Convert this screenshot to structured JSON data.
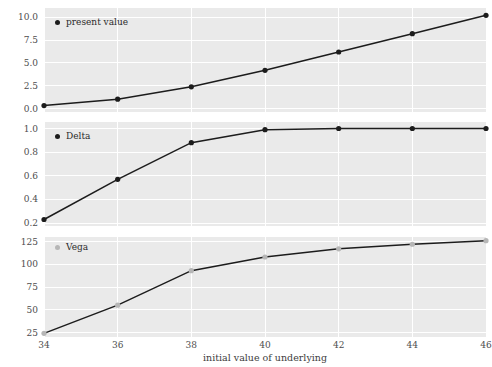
{
  "chart_data": [
    {
      "type": "line",
      "title": "",
      "xlabel": "",
      "ylabel": "",
      "legend": "present value",
      "legend_position": "upper left",
      "grid": true,
      "marker_color": "#1c1c1c",
      "line_color": "#1c1c1c",
      "x": [
        34,
        36,
        38,
        40,
        42,
        44,
        46
      ],
      "values": [
        0.35,
        1.05,
        2.4,
        4.2,
        6.2,
        8.2,
        10.2
      ],
      "xticks": [
        34,
        36,
        38,
        40,
        42,
        44,
        46
      ],
      "yticks": [
        0.0,
        2.5,
        5.0,
        7.5,
        10.0
      ],
      "ytick_labels": [
        "0.0",
        "2.5",
        "5.0",
        "7.5",
        "10.0"
      ],
      "xlim": [
        34,
        46
      ],
      "ylim": [
        -0.35,
        11.0
      ]
    },
    {
      "type": "line",
      "title": "",
      "xlabel": "",
      "ylabel": "",
      "legend": "Delta",
      "legend_position": "upper left",
      "grid": true,
      "marker_color": "#1c1c1c",
      "line_color": "#1c1c1c",
      "x": [
        34,
        36,
        38,
        40,
        42,
        44,
        46
      ],
      "values": [
        0.23,
        0.57,
        0.88,
        0.99,
        1.0,
        1.0,
        1.0
      ],
      "xticks": [
        34,
        36,
        38,
        40,
        42,
        44,
        46
      ],
      "yticks": [
        0.2,
        0.4,
        0.6,
        0.8,
        1.0
      ],
      "ytick_labels": [
        "0.2",
        "0.4",
        "0.6",
        "0.8",
        "1.0"
      ],
      "xlim": [
        34,
        46
      ],
      "ylim": [
        0.175,
        1.055
      ]
    },
    {
      "type": "line",
      "title": "",
      "xlabel": "initial value of underlying",
      "ylabel": "",
      "legend": "Vega",
      "legend_position": "upper left",
      "grid": true,
      "marker_color": "#b6b6b6",
      "line_color": "#1c1c1c",
      "x": [
        34,
        36,
        38,
        40,
        42,
        44,
        46
      ],
      "values": [
        24,
        55,
        93,
        108,
        117,
        122,
        126
      ],
      "xticks": [
        34,
        36,
        38,
        40,
        42,
        44,
        46
      ],
      "yticks": [
        25,
        50,
        75,
        100,
        125
      ],
      "ytick_labels": [
        "25",
        "50",
        "75",
        "100",
        "125"
      ],
      "xlim": [
        34,
        46
      ],
      "ylim": [
        20,
        130
      ]
    }
  ],
  "figure": {
    "xlabel": "initial value of underlying",
    "background": "#ffffff",
    "panel_background": "#eaeaea",
    "grid_color": "#ffffff"
  }
}
